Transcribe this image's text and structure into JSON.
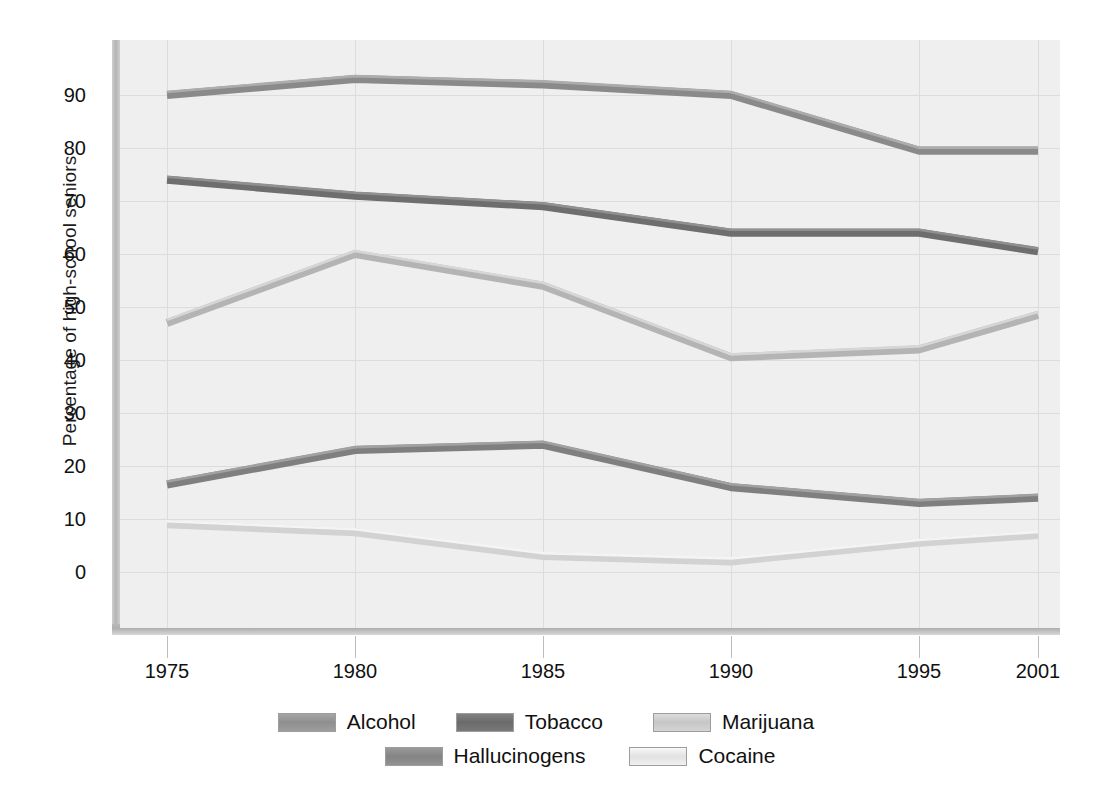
{
  "chart_data": {
    "type": "line",
    "title": "",
    "xlabel": "",
    "ylabel": "Percentage of high-school seniors",
    "categories": [
      "1975",
      "1980",
      "1985",
      "1990",
      "1995",
      "2001"
    ],
    "x_tick_labels": [
      "1975",
      "1980",
      "1985",
      "1990",
      "1995",
      "2001"
    ],
    "y_tick_labels": [
      "0",
      "10",
      "20",
      "30",
      "40",
      "50",
      "60",
      "70",
      "80",
      "90"
    ],
    "y_ticks": [
      0,
      10,
      20,
      30,
      40,
      50,
      60,
      70,
      80,
      90
    ],
    "ylim": [
      -3,
      98
    ],
    "grid": true,
    "legend_position": "bottom",
    "series": [
      {
        "name": "Alcohol",
        "color": "#8a8a8a",
        "values": [
          90.0,
          93.0,
          92.0,
          90.0,
          79.5,
          79.5
        ]
      },
      {
        "name": "Tobacco",
        "color": "#6e6e6e",
        "values": [
          74.0,
          71.0,
          69.0,
          64.0,
          64.0,
          60.5
        ]
      },
      {
        "name": "Marijuana",
        "color": "#b4b4b4",
        "values": [
          47.0,
          60.0,
          54.0,
          40.5,
          42.0,
          48.5
        ]
      },
      {
        "name": "Hallucinogens",
        "color": "#7f7f7f",
        "values": [
          16.5,
          23.0,
          24.0,
          16.0,
          13.0,
          14.0
        ]
      },
      {
        "name": "Cocaine",
        "color": "#d2d2d2",
        "values": [
          9.0,
          7.5,
          3.0,
          2.0,
          5.5,
          7.0
        ]
      }
    ]
  },
  "legend": {
    "rows": [
      [
        {
          "label": "Alcohol",
          "color": "#8f8f8f"
        },
        {
          "label": "Tobacco",
          "color": "#6b6b6b"
        },
        {
          "label": "Marijuana",
          "color": "#c6c6c6"
        }
      ],
      [
        {
          "label": "Hallucinogens",
          "color": "#848484"
        },
        {
          "label": "Cocaine",
          "color": "#e2e2e2"
        }
      ]
    ]
  },
  "colors": {
    "plot_background": "#efefef",
    "gridline": "#dcdcdc",
    "page_background": "#ffffff",
    "text": "#111111"
  }
}
